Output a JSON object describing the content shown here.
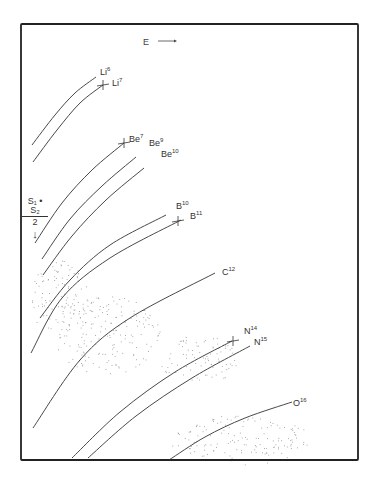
{
  "chart_data": {
    "type": "line",
    "title": "",
    "xlabel": "E →",
    "ylabel": "(S1+S2)/2 ↓",
    "grid": false,
    "legend": "none (curves labeled inline)",
    "frame_px": {
      "x0": 21,
      "y0": 24,
      "x1": 358,
      "y1": 460
    },
    "series": [
      {
        "name": "Li6",
        "label": "Li",
        "mass": "6",
        "marker": false,
        "points_px": [
          [
            32,
            145
          ],
          [
            55,
            115
          ],
          [
            75,
            93
          ],
          [
            96,
            77
          ]
        ]
      },
      {
        "name": "Li7",
        "label": "Li",
        "mass": "7",
        "marker": true,
        "points_px": [
          [
            33,
            162
          ],
          [
            57,
            130
          ],
          [
            80,
            103
          ],
          [
            103,
            85
          ]
        ]
      },
      {
        "name": "Be7",
        "label": "Be",
        "mass": "7",
        "marker": true,
        "points_px": [
          [
            35,
            243
          ],
          [
            62,
            203
          ],
          [
            92,
            170
          ],
          [
            124,
            143
          ]
        ]
      },
      {
        "name": "Be9",
        "label": "Be",
        "mass": "9",
        "marker": false,
        "points_px": [
          [
            42,
            259
          ],
          [
            70,
            219
          ],
          [
            102,
            186
          ],
          [
            136,
            157
          ]
        ]
      },
      {
        "name": "Be10",
        "label": "Be",
        "mass": "10",
        "marker": false,
        "points_px": [
          [
            43,
            275
          ],
          [
            72,
            236
          ],
          [
            106,
            200
          ],
          [
            144,
            168
          ]
        ]
      },
      {
        "name": "B10",
        "label": "B",
        "mass": "10",
        "marker": false,
        "points_px": [
          [
            40,
            318
          ],
          [
            70,
            280
          ],
          [
            110,
            245
          ],
          [
            166,
            215
          ]
        ]
      },
      {
        "name": "B11",
        "label": "B",
        "mass": "11",
        "marker": true,
        "points_px": [
          [
            31,
            353
          ],
          [
            62,
            298
          ],
          [
            110,
            258
          ],
          [
            181,
            220
          ]
        ]
      },
      {
        "name": "C12",
        "label": "C",
        "mass": "12",
        "marker": false,
        "points_px": [
          [
            33,
            428
          ],
          [
            80,
            360
          ],
          [
            130,
            318
          ],
          [
            215,
            273
          ]
        ]
      },
      {
        "name": "N14",
        "label": "N",
        "mass": "14",
        "marker": true,
        "points_px": [
          [
            72,
            458
          ],
          [
            120,
            412
          ],
          [
            175,
            372
          ],
          [
            232,
            341
          ]
        ]
      },
      {
        "name": "N15",
        "label": "N",
        "mass": "15",
        "marker": false,
        "points_px": [
          [
            88,
            458
          ],
          [
            136,
            416
          ],
          [
            192,
            378
          ],
          [
            250,
            346
          ]
        ]
      },
      {
        "name": "O16",
        "label": "O",
        "mass": "16",
        "marker": false,
        "points_px": [
          [
            169,
            460
          ],
          [
            205,
            437
          ],
          [
            245,
            418
          ],
          [
            292,
            402
          ]
        ]
      }
    ],
    "markers_px": [
      [
        103,
        85
      ],
      [
        124,
        143
      ],
      [
        178,
        221
      ],
      [
        233,
        341
      ]
    ],
    "scatter_clusters_px": [
      {
        "cx": 105,
        "cy": 335,
        "rx": 55,
        "ry": 40
      },
      {
        "cx": 60,
        "cy": 300,
        "rx": 30,
        "ry": 40
      },
      {
        "cx": 240,
        "cy": 440,
        "rx": 70,
        "ry": 25
      },
      {
        "cx": 200,
        "cy": 360,
        "rx": 40,
        "ry": 25
      }
    ]
  },
  "labels": {
    "x_axis": "E",
    "y_numerator": "S₁ • S₂",
    "y_denominator": "2",
    "y_arrow": "↓",
    "Li6": {
      "el": "Li",
      "m": "6"
    },
    "Li7": {
      "el": "Li",
      "m": "7"
    },
    "Be7": {
      "el": "Be",
      "m": "7"
    },
    "Be9": {
      "el": "Be",
      "m": "9"
    },
    "Be10": {
      "el": "Be",
      "m": "10"
    },
    "B10": {
      "el": "B",
      "m": "10"
    },
    "B11": {
      "el": "B",
      "m": "11"
    },
    "C12": {
      "el": "C",
      "m": "12"
    },
    "N14": {
      "el": "N",
      "m": "14"
    },
    "N15": {
      "el": "N",
      "m": "15"
    },
    "O16": {
      "el": "O",
      "m": "16"
    }
  }
}
